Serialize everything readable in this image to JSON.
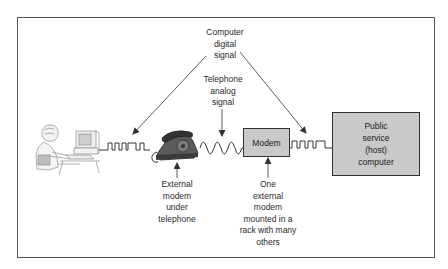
{
  "diagram": {
    "labels": {
      "digital_signal": [
        "Computer",
        "digital",
        "signal"
      ],
      "analog_signal": [
        "Telephone",
        "analog",
        "signal"
      ],
      "external_modem_phone": [
        "External",
        "modem",
        "under",
        "telephone"
      ],
      "rack_modem": [
        "One",
        "external",
        "modem",
        "mounted in a",
        "rack with many",
        "others"
      ]
    },
    "nodes": {
      "user": {
        "name": "Person at personal computer",
        "icon": "user-at-computer-icon"
      },
      "telephone": {
        "name": "Telephone",
        "icon": "telephone-icon"
      },
      "modem": {
        "label": "Modem"
      },
      "host": {
        "label": [
          "Public",
          "service",
          "(host)",
          "computer"
        ]
      }
    },
    "connections": [
      {
        "from": "user",
        "to": "telephone",
        "signal": "digital"
      },
      {
        "from": "telephone",
        "to": "modem",
        "signal": "analog"
      },
      {
        "from": "modem",
        "to": "host",
        "signal": "digital"
      }
    ],
    "colors": {
      "box_fill": "#c9c9c9",
      "line": "#333333",
      "sketch": "#9a9a9a"
    }
  }
}
